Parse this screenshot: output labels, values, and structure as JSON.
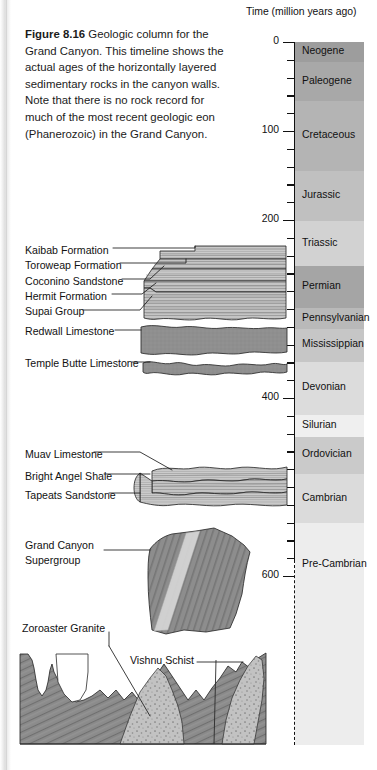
{
  "figure": {
    "number": "Figure 8.16",
    "caption": "Geologic column for the Grand Canyon. This timeline shows the actual ages of the horizontally layered sedimentary rocks in the canyon walls. Note that there is no rock record for much of the most recent geologic eon (Phanerozoic) in the Grand Canyon."
  },
  "axis": {
    "title": "Time (million years ago)",
    "unit": "million years ago",
    "range": [
      0,
      1200
    ],
    "px_per_myr": 0.89,
    "top_px": 42,
    "major_ticks": [
      {
        "value": 0,
        "label": "0"
      },
      {
        "value": 100,
        "label": "100"
      },
      {
        "value": 200,
        "label": "200"
      },
      {
        "value": 400,
        "label": "400"
      },
      {
        "value": 500,
        "label": "500"
      },
      {
        "value": 600,
        "label": "600"
      },
      {
        "value": 1200,
        "label": "1,200"
      }
    ],
    "minor_tick_interval": 20,
    "solid_until": 600,
    "dashed_after": 600
  },
  "chart_data": {
    "type": "bar",
    "title": "Geologic column for the Grand Canyon",
    "ylabel": "Time (million years ago)",
    "ylim": [
      0,
      1200
    ],
    "grid": false,
    "legend": "none",
    "categories": [
      "Neogene",
      "Paleogene",
      "Cretaceous",
      "Jurassic",
      "Triassic",
      "Permian",
      "Pennsylvanian",
      "Mississippian",
      "Devonian",
      "Silurian",
      "Ordovician",
      "Cambrian",
      "Pre-Cambrian"
    ],
    "periods": [
      {
        "name": "Neogene",
        "start": 0,
        "end": 23,
        "color": "#9d9d9d"
      },
      {
        "name": "Paleogene",
        "start": 23,
        "end": 66,
        "color": "#a8a8a8"
      },
      {
        "name": "Cretaceous",
        "start": 66,
        "end": 145,
        "color": "#b4b4b4"
      },
      {
        "name": "Jurassic",
        "start": 145,
        "end": 201,
        "color": "#c0c0c0"
      },
      {
        "name": "Triassic",
        "start": 201,
        "end": 252,
        "color": "#d2d2d2"
      },
      {
        "name": "Permian",
        "start": 252,
        "end": 299,
        "color": "#a5a5a5"
      },
      {
        "name": "Pennsylvanian",
        "start": 299,
        "end": 323,
        "color": "#b9b9b9"
      },
      {
        "name": "Mississippian",
        "start": 323,
        "end": 359,
        "color": "#c6c6c6"
      },
      {
        "name": "Devonian",
        "start": 359,
        "end": 419,
        "color": "#dcdcdc"
      },
      {
        "name": "Silurian",
        "start": 419,
        "end": 444,
        "color": "#efefef"
      },
      {
        "name": "Ordovician",
        "start": 444,
        "end": 485,
        "color": "#cacaca"
      },
      {
        "name": "Cambrian",
        "start": 485,
        "end": 541,
        "color": "#dbdbdb"
      },
      {
        "name": "Pre-Cambrian",
        "start": 541,
        "end": 1230,
        "color": "#ededed"
      }
    ],
    "formations": [
      {
        "name": "Kaibab Formation",
        "label_y": 251
      },
      {
        "name": "Toroweap Formation",
        "label_y": 266
      },
      {
        "name": "Coconino Sandstone",
        "label_y": 282
      },
      {
        "name": "Hermit Formation",
        "label_y": 297
      },
      {
        "name": "Supai Group",
        "label_y": 312
      },
      {
        "name": "Redwall Limestone",
        "label_y": 332
      },
      {
        "name": "Temple Butte Limestone",
        "label_y": 364
      },
      {
        "name": "Muav Limestone",
        "label_y": 455
      },
      {
        "name": "Bright Angel Shale",
        "label_y": 477
      },
      {
        "name": "Tapeats Sandstone",
        "label_y": 496
      },
      {
        "name": "Grand Canyon Supergroup",
        "label_y": 553
      },
      {
        "name": "Zoroaster Granite",
        "label_y": 629
      },
      {
        "name": "Vishnu Schist",
        "label_y": 661
      }
    ]
  },
  "colors": {
    "rock_light": "#c9c9c9",
    "rock_medium": "#9a9a9a",
    "rock_dark": "#7f7f7f",
    "outline": "#2a2a2a",
    "text": "#111111"
  }
}
